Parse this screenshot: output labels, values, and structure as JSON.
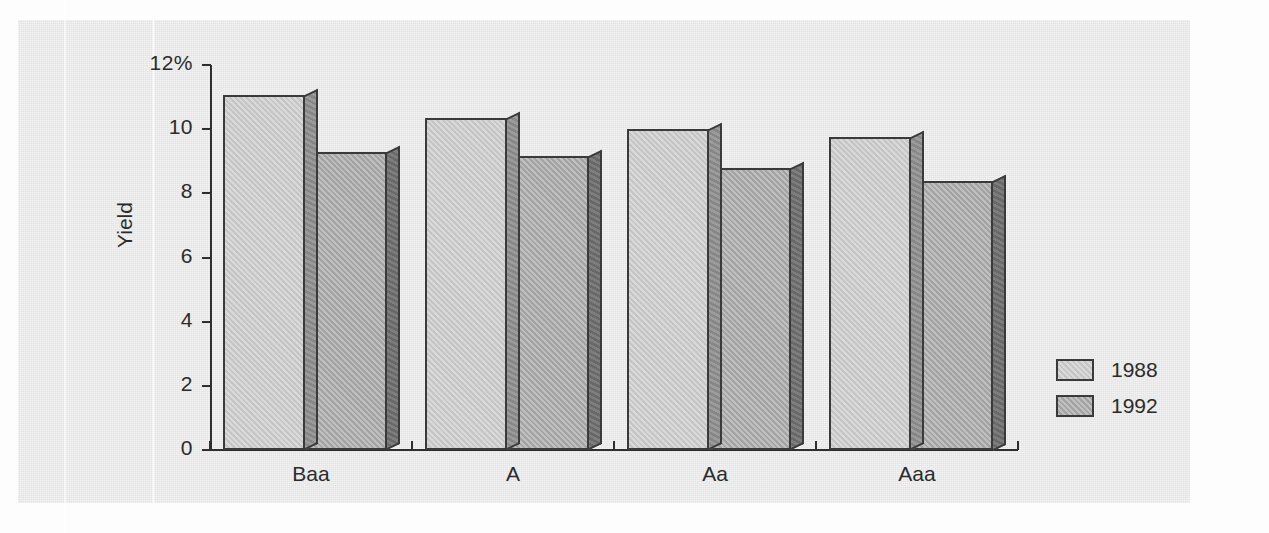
{
  "chart_data": {
    "type": "bar",
    "title": "",
    "subtitle": "",
    "xlabel": "",
    "ylabel": "Yield",
    "categories": [
      "Baa",
      "A",
      "Aa",
      "Aaa"
    ],
    "series": [
      {
        "name": "1988",
        "color": "#c9c9c9",
        "values": [
          11.05,
          10.35,
          10.0,
          9.75
        ]
      },
      {
        "name": "1992",
        "color": "#a9a9a9",
        "values": [
          9.3,
          9.15,
          8.8,
          8.4
        ]
      }
    ],
    "ylim": [
      0,
      12
    ],
    "y_ticks": [
      0,
      2,
      4,
      6,
      8,
      10,
      12
    ],
    "y_tick_labels": [
      "0",
      "2",
      "4",
      "6",
      "8",
      "10",
      "12%"
    ],
    "grid": false,
    "legend_position": "right",
    "style": "3d-extruded-bars",
    "annotations": []
  },
  "axes": {
    "y_title": "Yield",
    "y_tick_labels": [
      "12%",
      "10",
      "8",
      "6",
      "4",
      "2",
      "0"
    ],
    "x_tick_labels": [
      "Baa",
      "A",
      "Aa",
      "Aaa"
    ]
  },
  "legend": {
    "entries": [
      {
        "label": "1988",
        "swatch": "light-gray-swatch"
      },
      {
        "label": "1992",
        "swatch": "dark-gray-swatch"
      }
    ]
  },
  "colors": {
    "panel_background": "#e9e9e9",
    "page_background": "#fdfdfd",
    "axis": "#2e2e2e",
    "text": "#2b2b2b",
    "series_1988_face": "#c9c9c9",
    "series_1988_side": "#8e8e8e",
    "series_1992_face": "#a9a9a9",
    "series_1992_side": "#6f6f6f"
  }
}
